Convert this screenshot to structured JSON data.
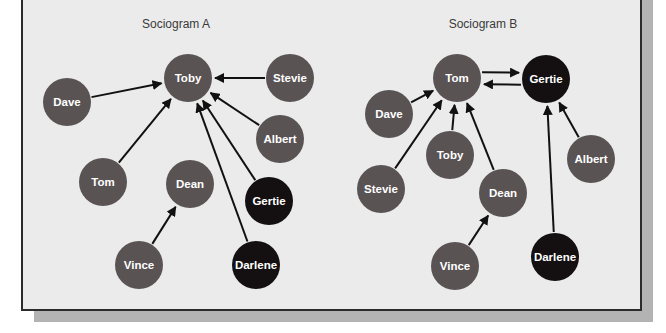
{
  "colors": {
    "background": "#ebebeb",
    "border": "#2b2b2b",
    "shadow": "#b3b3b3",
    "node_gray": "#595354",
    "node_black": "#141011",
    "edge": "#111111",
    "title_text": "#3a3a3a",
    "label_text": "#ffffff"
  },
  "sociograms": [
    {
      "title": "Sociogram A",
      "title_pos": [
        176,
        28
      ],
      "nodes": [
        {
          "name": "Toby",
          "x": 188,
          "y": 78,
          "fill": "gray"
        },
        {
          "name": "Stevie",
          "x": 290,
          "y": 78,
          "fill": "gray"
        },
        {
          "name": "Dave",
          "x": 67,
          "y": 102,
          "fill": "gray"
        },
        {
          "name": "Albert",
          "x": 280,
          "y": 139,
          "fill": "gray"
        },
        {
          "name": "Tom",
          "x": 103,
          "y": 182,
          "fill": "gray"
        },
        {
          "name": "Dean",
          "x": 190,
          "y": 184,
          "fill": "gray"
        },
        {
          "name": "Gertie",
          "x": 269,
          "y": 201,
          "fill": "black"
        },
        {
          "name": "Vince",
          "x": 139,
          "y": 265,
          "fill": "gray"
        },
        {
          "name": "Darlene",
          "x": 256,
          "y": 265,
          "fill": "black"
        }
      ],
      "edges": [
        {
          "from": "Stevie",
          "to": "Toby"
        },
        {
          "from": "Dave",
          "to": "Toby"
        },
        {
          "from": "Albert",
          "to": "Toby"
        },
        {
          "from": "Tom",
          "to": "Toby"
        },
        {
          "from": "Gertie",
          "to": "Toby"
        },
        {
          "from": "Darlene",
          "to": "Toby"
        },
        {
          "from": "Vince",
          "to": "Dean"
        }
      ]
    },
    {
      "title": "Sociogram B",
      "title_pos": [
        483,
        28
      ],
      "nodes": [
        {
          "name": "Tom",
          "x": 457,
          "y": 78,
          "fill": "gray"
        },
        {
          "name": "Gertie",
          "x": 546,
          "y": 79,
          "fill": "black"
        },
        {
          "name": "Dave",
          "x": 389,
          "y": 114,
          "fill": "gray"
        },
        {
          "name": "Toby",
          "x": 450,
          "y": 155,
          "fill": "gray"
        },
        {
          "name": "Albert",
          "x": 591,
          "y": 159,
          "fill": "gray"
        },
        {
          "name": "Stevie",
          "x": 381,
          "y": 189,
          "fill": "gray"
        },
        {
          "name": "Dean",
          "x": 503,
          "y": 193,
          "fill": "gray"
        },
        {
          "name": "Vince",
          "x": 455,
          "y": 266,
          "fill": "gray"
        },
        {
          "name": "Darlene",
          "x": 555,
          "y": 257,
          "fill": "black"
        }
      ],
      "edges": [
        {
          "from": "Tom",
          "to": "Gertie",
          "offset": -6
        },
        {
          "from": "Gertie",
          "to": "Tom",
          "offset": -6
        },
        {
          "from": "Dave",
          "to": "Tom"
        },
        {
          "from": "Toby",
          "to": "Tom"
        },
        {
          "from": "Stevie",
          "to": "Tom"
        },
        {
          "from": "Dean",
          "to": "Tom"
        },
        {
          "from": "Albert",
          "to": "Gertie"
        },
        {
          "from": "Darlene",
          "to": "Gertie"
        },
        {
          "from": "Vince",
          "to": "Dean"
        }
      ]
    }
  ],
  "node_radius": 24
}
